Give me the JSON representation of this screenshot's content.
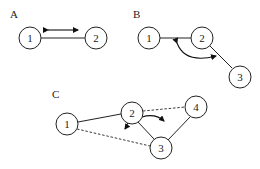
{
  "panels": [
    {
      "label": "A",
      "nodes": [
        "1",
        "2"
      ]
    },
    {
      "label": "B",
      "nodes": [
        "1",
        "2",
        "3"
      ]
    },
    {
      "label": "C",
      "nodes": [
        "1",
        "2",
        "3",
        "4"
      ]
    }
  ],
  "colors": {
    "stroke": "#222222",
    "background": "#ffffff"
  }
}
